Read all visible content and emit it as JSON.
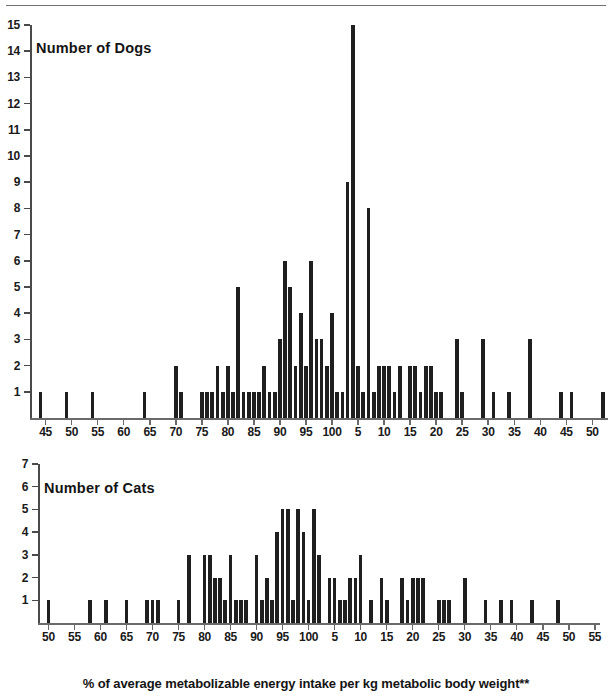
{
  "figure": {
    "caption": "% of average metabolizable energy intake per kg metabolic body weight**",
    "top_rule": true,
    "bar_color": "#1f1f1f",
    "axis_color": "#6a6a6a"
  },
  "chart_data": [
    {
      "type": "bar",
      "id": "dogs-histogram",
      "title": "Number of Dogs",
      "xlabel": "% of average metabolizable energy intake per kg metabolic body weight**",
      "ylabel": "Number of Dogs",
      "grid": false,
      "legend": null,
      "xlim": [
        42,
        153
      ],
      "ylim": [
        0,
        15
      ],
      "ytick_labels": [
        "1",
        "2",
        "3",
        "4",
        "5",
        "6",
        "7",
        "8",
        "9",
        "10",
        "11",
        "12",
        "13",
        "14",
        "15"
      ],
      "ytick_values": [
        1,
        2,
        3,
        4,
        5,
        6,
        7,
        8,
        9,
        10,
        11,
        12,
        13,
        14,
        15
      ],
      "xtick_values": [
        45,
        50,
        55,
        60,
        65,
        70,
        75,
        80,
        85,
        90,
        95,
        100,
        105,
        110,
        115,
        120,
        125,
        130,
        135,
        140,
        145,
        150
      ],
      "xtick_labels": [
        "45",
        "50",
        "55",
        "60",
        "65",
        "70",
        "75",
        "80",
        "85",
        "90",
        "95",
        "100",
        "5",
        "10",
        "15",
        "20",
        "25",
        "30",
        "35",
        "40",
        "45",
        "50"
      ],
      "bin_width": 1,
      "x": [
        44,
        49,
        54,
        64,
        70,
        71,
        75,
        76,
        77,
        78,
        79,
        80,
        81,
        82,
        83,
        84,
        85,
        86,
        87,
        88,
        89,
        90,
        91,
        92,
        93,
        94,
        95,
        96,
        97,
        98,
        99,
        100,
        101,
        102,
        103,
        104,
        105,
        106,
        107,
        108,
        109,
        110,
        111,
        112,
        113,
        115,
        116,
        117,
        118,
        119,
        120,
        121,
        124,
        125,
        129,
        131,
        134,
        138,
        144,
        146,
        152
      ],
      "values": [
        1,
        1,
        1,
        1,
        2,
        1,
        1,
        1,
        1,
        2,
        1,
        2,
        1,
        5,
        1,
        1,
        1,
        1,
        2,
        1,
        1,
        3,
        6,
        5,
        2,
        4,
        2,
        6,
        3,
        3,
        2,
        4,
        1,
        1,
        9,
        15,
        2,
        1,
        8,
        1,
        2,
        2,
        2,
        1,
        2,
        2,
        2,
        1,
        2,
        2,
        1,
        1,
        3,
        1,
        3,
        1,
        1,
        3,
        1,
        1,
        1,
        1,
        1
      ],
      "peak": {
        "x": 104,
        "value": 15
      }
    },
    {
      "type": "bar",
      "id": "cats-histogram",
      "title": "Number of Cats",
      "xlabel": "% of average metabolizable energy intake per kg metabolic body weight**",
      "ylabel": "Number of Cats",
      "grid": false,
      "legend": null,
      "xlim": [
        48,
        156
      ],
      "ylim": [
        0,
        7
      ],
      "ytick_labels": [
        "1",
        "2",
        "3",
        "4",
        "5",
        "6",
        "7"
      ],
      "ytick_values": [
        1,
        2,
        3,
        4,
        5,
        6,
        7
      ],
      "xtick_values": [
        50,
        55,
        60,
        65,
        70,
        75,
        80,
        85,
        90,
        95,
        100,
        105,
        110,
        115,
        120,
        125,
        130,
        135,
        140,
        145,
        150,
        155
      ],
      "xtick_labels": [
        "50",
        "55",
        "60",
        "65",
        "70",
        "75",
        "80",
        "85",
        "90",
        "95",
        "100",
        "5",
        "10",
        "15",
        "20",
        "25",
        "30",
        "35",
        "40",
        "45",
        "50",
        "55"
      ],
      "bin_width": 1,
      "x": [
        50,
        58,
        61,
        65,
        69,
        70,
        71,
        75,
        77,
        80,
        81,
        82,
        83,
        84,
        85,
        86,
        87,
        88,
        90,
        91,
        92,
        93,
        94,
        95,
        96,
        97,
        98,
        99,
        100,
        101,
        102,
        104,
        105,
        106,
        107,
        108,
        109,
        110,
        112,
        114,
        115,
        118,
        119,
        120,
        121,
        122,
        125,
        126,
        127,
        130,
        134,
        137,
        139,
        143,
        148
      ],
      "values": [
        1,
        1,
        1,
        1,
        1,
        1,
        1,
        1,
        3,
        3,
        3,
        2,
        2,
        1,
        3,
        1,
        1,
        1,
        3,
        1,
        2,
        1,
        4,
        5,
        5,
        1,
        5,
        4,
        1,
        5,
        3,
        2,
        2,
        1,
        1,
        2,
        2,
        3,
        1,
        2,
        1,
        2,
        1,
        2,
        2,
        2,
        1,
        1,
        1,
        2,
        1,
        1,
        1,
        1,
        1
      ],
      "peak": {
        "x": 95,
        "value": 5
      }
    }
  ]
}
